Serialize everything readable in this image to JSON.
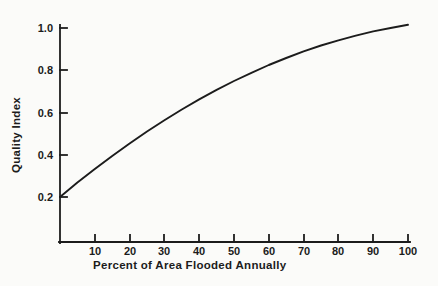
{
  "page": {
    "background": "#fbfbf9",
    "ink": "#1c1c1c"
  },
  "chart_data": {
    "type": "line",
    "title": "",
    "xlabel": "Percent of Area Flooded Annually",
    "ylabel": "Quality Index",
    "xlim": [
      0,
      100
    ],
    "ylim": [
      0,
      1.05
    ],
    "grid": false,
    "legend_position": "none",
    "x_ticks": [
      10,
      20,
      30,
      40,
      50,
      60,
      70,
      80,
      90,
      100
    ],
    "y_ticks": [
      0.2,
      0.4,
      0.6,
      0.8,
      1.0
    ],
    "x_tick_labels": [
      "10",
      "20",
      "30",
      "40",
      "50",
      "60",
      "70",
      "80",
      "90",
      "100"
    ],
    "y_tick_labels_top_to_bottom": [
      "1.0",
      "0.8",
      "0.6",
      "0.4",
      "0.2"
    ],
    "line_color": "#1c1c1c",
    "series": [
      {
        "name": "Quality Index vs Percent of Area Flooded Annually",
        "x": [
          0,
          5,
          10,
          15,
          20,
          25,
          30,
          35,
          40,
          45,
          50,
          55,
          60,
          65,
          70,
          75,
          80,
          85,
          90,
          95,
          100
        ],
        "y": [
          0.2,
          0.268,
          0.332,
          0.394,
          0.453,
          0.51,
          0.563,
          0.614,
          0.662,
          0.707,
          0.749,
          0.788,
          0.825,
          0.858,
          0.889,
          0.917,
          0.942,
          0.964,
          0.984,
          1.0,
          1.015
        ]
      }
    ]
  }
}
